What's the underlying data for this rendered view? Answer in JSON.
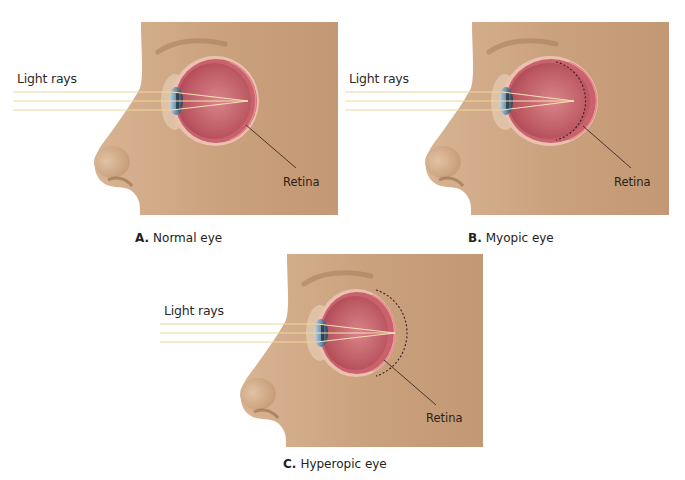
{
  "figure": {
    "colors": {
      "skin": "#c9a07c",
      "skin_light": "#dcbc9c",
      "skin_shadow": "#a97d5a",
      "eyeball": "#b8545e",
      "eyeball_inner": "#cf7078",
      "sclera_rim": "#e8b8a8",
      "light_ray": "#f2dca0",
      "cornea": "#7fa0b8",
      "leader_line": "#3a2a20"
    },
    "panels": [
      {
        "id": "A",
        "letter": "A.",
        "caption": "Normal eye",
        "light_rays_label": "Light rays",
        "retina_label": "Retina",
        "condition": "normal",
        "focus": "on retina"
      },
      {
        "id": "B",
        "letter": "B.",
        "caption": "Myopic eye",
        "light_rays_label": "Light rays",
        "retina_label": "Retina",
        "condition": "myopia",
        "focus": "in front of retina (elongated eyeball, dashed outline shows normal shape)"
      },
      {
        "id": "C",
        "letter": "C.",
        "caption": "Hyperopic eye",
        "light_rays_label": "Light rays",
        "retina_label": "Retina",
        "condition": "hyperopia",
        "focus": "behind retina (shortened eyeball, dashed outline shows normal shape)"
      }
    ]
  }
}
